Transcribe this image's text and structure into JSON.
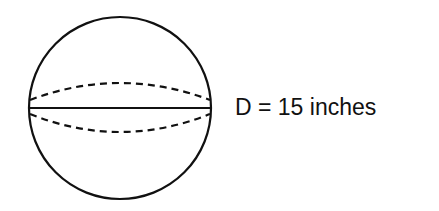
{
  "diagram": {
    "shape": "sphere",
    "label": "D = 15 inches",
    "diameter_value": 15,
    "diameter_unit": "inches",
    "stroke_color": "#111111",
    "background": "#ffffff"
  }
}
